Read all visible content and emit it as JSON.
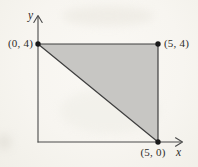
{
  "figure": {
    "axis": {
      "x_label": "x",
      "y_label": "y"
    },
    "points": [
      {
        "name": "top-left",
        "label": "(0, 4)",
        "x": 0,
        "y": 4
      },
      {
        "name": "top-right",
        "label": "(5, 4)",
        "x": 5,
        "y": 4
      },
      {
        "name": "bottom-right",
        "label": "(5, 0)",
        "x": 5,
        "y": 0
      }
    ],
    "region": {
      "type": "triangle",
      "shaded": true,
      "vertices": [
        [
          0,
          4
        ],
        [
          5,
          4
        ],
        [
          5,
          0
        ]
      ]
    },
    "colors": {
      "paper": "#f7f5f0",
      "shade": "#c7c6c3",
      "line": "#3e3e3e",
      "axis": "#4a4a4a",
      "dot": "#1a1a1a",
      "ink": "#2e2c29"
    }
  }
}
